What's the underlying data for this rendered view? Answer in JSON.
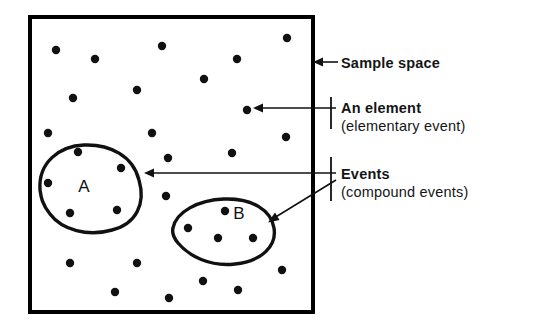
{
  "figure": {
    "colors": {
      "ink": "#111111",
      "background": "#ffffff",
      "dot": "#111111",
      "border": "#000000"
    },
    "sample_space_box": {
      "x": 30,
      "y": 17,
      "width": 283,
      "height": 295,
      "stroke_width": 4
    },
    "regions": [
      {
        "name": "A",
        "label": "A",
        "label_x": 84,
        "label_y": 192,
        "path": "M 40 190 C 38 162 60 146 84 145 C 110 144 133 156 139 180 C 146 204 136 224 112 230 C 88 237 62 230 50 214 C 42 204 41 197 40 190 Z",
        "stroke_width": 3.4,
        "dots": [
          {
            "x": 78,
            "y": 152
          },
          {
            "x": 121,
            "y": 168
          },
          {
            "x": 48,
            "y": 183
          },
          {
            "x": 70,
            "y": 213
          },
          {
            "x": 117,
            "y": 210
          }
        ]
      },
      {
        "name": "B",
        "label": "B",
        "label_x": 239,
        "label_y": 219,
        "path": "M 173 228 C 176 212 198 200 224 199 C 252 198 271 210 274 228 C 277 246 262 261 235 264 C 210 267 189 256 178 243 C 173 237 172 232 173 228 Z",
        "stroke_width": 3.4,
        "dots": [
          {
            "x": 225,
            "y": 211
          },
          {
            "x": 188,
            "y": 228
          },
          {
            "x": 218,
            "y": 238
          },
          {
            "x": 253,
            "y": 238
          }
        ]
      }
    ],
    "scatter_dots": [
      {
        "x": 56,
        "y": 50
      },
      {
        "x": 95,
        "y": 59
      },
      {
        "x": 162,
        "y": 46
      },
      {
        "x": 287,
        "y": 38
      },
      {
        "x": 237,
        "y": 59
      },
      {
        "x": 137,
        "y": 90
      },
      {
        "x": 73,
        "y": 98
      },
      {
        "x": 204,
        "y": 79
      },
      {
        "x": 247,
        "y": 110
      },
      {
        "x": 48,
        "y": 133
      },
      {
        "x": 152,
        "y": 133
      },
      {
        "x": 286,
        "y": 137
      },
      {
        "x": 232,
        "y": 153
      },
      {
        "x": 168,
        "y": 158
      },
      {
        "x": 166,
        "y": 196
      },
      {
        "x": 70,
        "y": 263
      },
      {
        "x": 137,
        "y": 263
      },
      {
        "x": 115,
        "y": 292
      },
      {
        "x": 169,
        "y": 298
      },
      {
        "x": 203,
        "y": 281
      },
      {
        "x": 238,
        "y": 290
      },
      {
        "x": 282,
        "y": 270
      }
    ],
    "dot_radius": 4.2,
    "annotations": [
      {
        "id": "sample-space",
        "lines": [
          "Sample space"
        ],
        "text_x": 340,
        "text_y": 68,
        "arrow": "M 338 62 L 316 62",
        "arrow_head": "M 313 62 L 322 58 L 322 66 Z"
      },
      {
        "id": "an-element",
        "lines": [
          "An element",
          "(elementary event)"
        ],
        "text_x": 340,
        "text_y": 112,
        "arrow": "M 338 108 L 256 108",
        "arrow_head": "M 252 108 L 262 104 L 262 112 Z",
        "tick": "M 331 98 L 331 128"
      },
      {
        "id": "events",
        "lines": [
          "Events",
          "(compound events)"
        ],
        "text_x": 340,
        "text_y": 178,
        "arrow": "M 338 173 L 148 173",
        "arrow_head": "M 144 173 L 154 169 L 154 177 Z",
        "arrow2": "M 334 181 L 272 219",
        "arrow_head2": "M 268 222 L 278 219 L 274 212 Z",
        "tick": "M 331 158 L 331 200"
      }
    ]
  },
  "annotation_labels": {
    "sample_space": "Sample space",
    "an_element_line1": "An element",
    "an_element_line2": "(elementary event)",
    "events_line1": "Events",
    "events_line2": "(compound events)"
  },
  "region_labels": {
    "a": "A",
    "b": "B"
  }
}
